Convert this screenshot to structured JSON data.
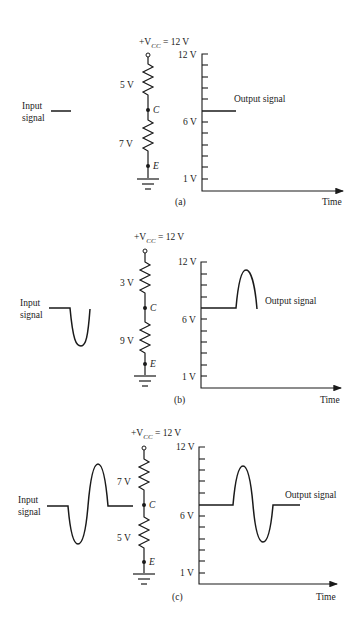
{
  "figure": {
    "panels": [
      {
        "id": "a",
        "caption": "(a)",
        "vcc_label_prefix": "+V",
        "vcc_label_sub": "CC",
        "vcc_label_suffix": " = 12 V",
        "upper_resistor_drop": "5 V",
        "lower_resistor_drop": "7 V",
        "node_c": "C",
        "node_e": "E",
        "input_label_line1": "Input",
        "input_label_line2": "signal",
        "output_label": "Output signal",
        "axis_top": "12 V",
        "axis_mid": "6 V",
        "axis_bottom": "1 V",
        "axis_x": "Time"
      },
      {
        "id": "b",
        "caption": "(b)",
        "vcc_label_prefix": "+V",
        "vcc_label_sub": "CC",
        "vcc_label_suffix": " = 12 V",
        "upper_resistor_drop": "3 V",
        "lower_resistor_drop": "9 V",
        "node_c": "C",
        "node_e": "E",
        "input_label_line1": "Input",
        "input_label_line2": "signal",
        "output_label": "Output signal",
        "axis_top": "12 V",
        "axis_mid": "6 V",
        "axis_bottom": "1 V",
        "axis_x": "Time"
      },
      {
        "id": "c",
        "caption": "(c)",
        "vcc_label_prefix": "+V",
        "vcc_label_sub": "CC",
        "vcc_label_suffix": " = 12 V",
        "upper_resistor_drop": "7 V",
        "lower_resistor_drop": "5 V",
        "node_c": "C",
        "node_e": "E",
        "input_label_line1": "Input",
        "input_label_line2": "signal",
        "output_label": "Output signal",
        "axis_top": "12 V",
        "axis_mid": "6 V",
        "axis_bottom": "1 V",
        "axis_x": "Time"
      }
    ]
  }
}
